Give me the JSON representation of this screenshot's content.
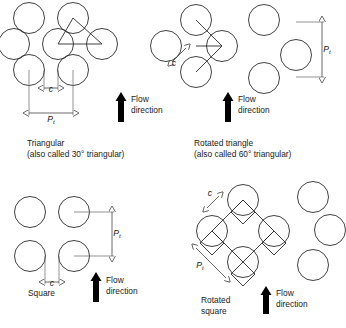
{
  "figure": {
    "background_color": "#ffffff",
    "line_color": "#2b2b2b",
    "dim_color": "#444444",
    "text_color": "#1a1a1a",
    "width": 346,
    "height": 328
  },
  "symbols": {
    "clearance": "c",
    "pitch": "P",
    "pitch_subscript": "t",
    "degree": "°"
  },
  "flow_labels": {
    "line1": "Flow",
    "line2": "direction"
  },
  "panels": [
    {
      "id": "triangular",
      "caption_line1": "Triangular",
      "caption_line2": "(also called 30° triangular)",
      "tube_radius": 15.5,
      "tube_centers": [
        [
          29,
          18
        ],
        [
          73,
          18
        ],
        [
          14,
          44
        ],
        [
          58,
          44
        ],
        [
          102,
          44
        ],
        [
          29,
          70
        ],
        [
          73,
          70
        ]
      ],
      "pattern_polyline": [
        [
          58,
          44
        ],
        [
          73,
          18
        ],
        [
          102,
          44
        ],
        [
          58,
          44
        ]
      ],
      "dimensions": [
        {
          "name": "clearance",
          "label": "c",
          "subscript": "",
          "orientation": "horizontal",
          "x1": 44,
          "y1": 88,
          "x2": 58,
          "y2": 88,
          "label_x": 51,
          "label_y": 91.5,
          "extensions": [
            {
              "x1": 44,
              "y1": 70,
              "x2": 44,
              "y2": 90
            },
            {
              "x1": 58,
              "y1": 70,
              "x2": 58,
              "y2": 90
            }
          ]
        },
        {
          "name": "tube-pitch",
          "label": "P",
          "subscript": "t",
          "orientation": "horizontal",
          "x1": 29,
          "y1": 113,
          "x2": 73,
          "y2": 113,
          "label_x": 51,
          "label_y": 122,
          "extensions": [
            {
              "x1": 29,
              "y1": 70,
              "x2": 29,
              "y2": 115
            },
            {
              "x1": 73,
              "y1": 70,
              "x2": 73,
              "y2": 115
            }
          ]
        }
      ],
      "flow_arrow": {
        "x": 121,
        "y_top": 92,
        "y_bottom": 122,
        "width": 6
      },
      "flow_text_x": 131,
      "flow_text_y": 102,
      "caption_x": 27,
      "caption_y": 146
    },
    {
      "id": "rotated-triangle",
      "caption_line1": "Rotated triangle",
      "caption_line2": "(also called 60° triangular)",
      "tube_radius": 15.5,
      "tube_centers": [
        [
          196,
          20
        ],
        [
          264,
          20
        ],
        [
          166,
          46
        ],
        [
          222,
          46
        ],
        [
          296,
          55
        ],
        [
          196,
          72
        ],
        [
          264,
          78
        ]
      ],
      "pattern_polyline": [
        [
          196,
          20
        ],
        [
          222,
          46
        ],
        [
          196,
          72
        ]
      ],
      "pattern_polyline2": [
        [
          196,
          46
        ],
        [
          222,
          46
        ]
      ],
      "dimensions": [
        {
          "name": "clearance",
          "label": "c",
          "subscript": "",
          "orientation": "diagonal",
          "x1": 172,
          "y1": 62,
          "x2": 186,
          "y2": 48,
          "label_x": 174,
          "label_y": 66,
          "extensions": []
        },
        {
          "name": "tube-pitch",
          "label": "P",
          "subscript": "t",
          "orientation": "vertical",
          "x1": 322,
          "y1": 22,
          "x2": 322,
          "y2": 77,
          "label_x": 327,
          "label_y": 52,
          "extensions": [
            {
              "x1": 296,
              "y1": 22,
              "x2": 324,
              "y2": 22
            },
            {
              "x1": 296,
              "y1": 77,
              "x2": 324,
              "y2": 77
            }
          ]
        }
      ],
      "flow_arrow": {
        "x": 228,
        "y_top": 92,
        "y_bottom": 122,
        "width": 6
      },
      "flow_text_x": 238,
      "flow_text_y": 102,
      "caption_x": 194,
      "caption_y": 146
    },
    {
      "id": "square",
      "caption_line1": "Square",
      "caption_line2": "",
      "tube_radius": 15.5,
      "tube_centers": [
        [
          30,
          212
        ],
        [
          74,
          212
        ],
        [
          30,
          256
        ],
        [
          74,
          256
        ]
      ],
      "pattern_polyline": [],
      "dimensions": [
        {
          "name": "clearance",
          "label": "c",
          "subscript": "",
          "orientation": "horizontal",
          "x1": 45,
          "y1": 282,
          "x2": 59,
          "y2": 282,
          "label_x": 52,
          "label_y": 285.5,
          "extensions": [
            {
              "x1": 45,
              "y1": 256,
              "x2": 45,
              "y2": 284
            },
            {
              "x1": 59,
              "y1": 256,
              "x2": 59,
              "y2": 284
            }
          ]
        },
        {
          "name": "tube-pitch",
          "label": "P",
          "subscript": "t",
          "orientation": "vertical",
          "x1": 112,
          "y1": 212,
          "x2": 112,
          "y2": 256,
          "label_x": 117,
          "label_y": 236,
          "extensions": [
            {
              "x1": 74,
              "y1": 212,
              "x2": 114,
              "y2": 212
            },
            {
              "x1": 74,
              "y1": 256,
              "x2": 114,
              "y2": 256
            }
          ]
        }
      ],
      "flow_arrow": {
        "x": 96,
        "y_top": 272,
        "y_bottom": 302,
        "width": 6
      },
      "flow_text_x": 106,
      "flow_text_y": 283,
      "caption_x": 28,
      "caption_y": 296
    },
    {
      "id": "rotated-square",
      "caption_line1": "Rotated",
      "caption_line2": "square",
      "tube_radius": 15.5,
      "tube_centers": [
        [
          243,
          200
        ],
        [
          212,
          231
        ],
        [
          274,
          231
        ],
        [
          243,
          262
        ],
        [
          313,
          197
        ],
        [
          330,
          230
        ],
        [
          313,
          265
        ]
      ],
      "pattern_polyline": [
        [
          243,
          200
        ],
        [
          212,
          231
        ],
        [
          243,
          262
        ],
        [
          274,
          231
        ],
        [
          243,
          200
        ]
      ],
      "diamonds": [
        [
          [
            243,
            200
          ],
          [
            231,
            212
          ],
          [
            243,
            224
          ],
          [
            255,
            212
          ]
        ],
        [
          [
            212,
            231
          ],
          [
            200,
            243
          ],
          [
            212,
            255
          ],
          [
            224,
            243
          ]
        ],
        [
          [
            274,
            231
          ],
          [
            262,
            243
          ],
          [
            274,
            255
          ],
          [
            286,
            243
          ]
        ],
        [
          [
            243,
            262
          ],
          [
            231,
            274
          ],
          [
            243,
            286
          ],
          [
            255,
            274
          ]
        ]
      ],
      "dimensions": [
        {
          "name": "clearance",
          "label": "c",
          "subscript": "",
          "orientation": "diagonal",
          "x1": 207,
          "y1": 208,
          "x2": 219,
          "y2": 196,
          "label_x": 210,
          "label_y": 196,
          "extensions": []
        },
        {
          "name": "tube-pitch",
          "label": "P",
          "subscript": "t",
          "orientation": "diagonal",
          "x1": 196,
          "y1": 248,
          "x2": 226,
          "y2": 278,
          "label_x": 200,
          "label_y": 268,
          "extensions": []
        }
      ],
      "flow_arrow": {
        "x": 266,
        "y_top": 286,
        "y_bottom": 314,
        "width": 6
      },
      "flow_text_x": 276,
      "flow_text_y": 296,
      "caption_x": 201,
      "caption_y": 303
    }
  ]
}
